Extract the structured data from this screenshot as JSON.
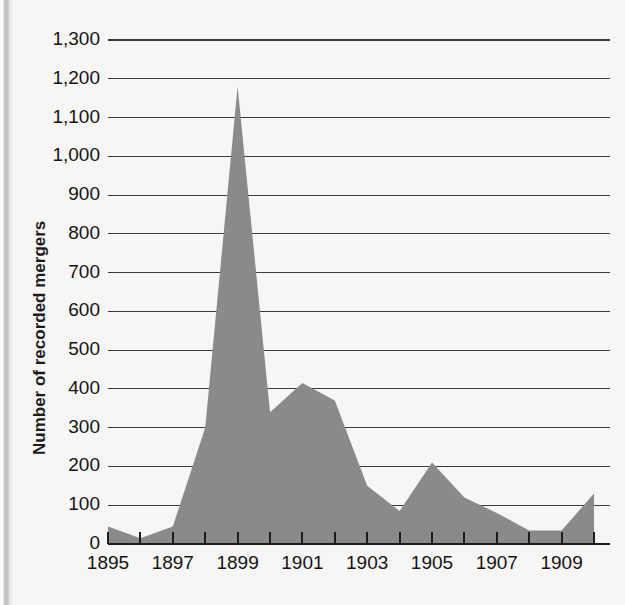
{
  "chart_data": {
    "type": "area",
    "title": "",
    "xlabel": "",
    "ylabel": "Number of recorded mergers",
    "x": [
      1895,
      1896,
      1897,
      1898,
      1899,
      1900,
      1901,
      1902,
      1903,
      1904,
      1905,
      1906,
      1907,
      1908,
      1909,
      1910
    ],
    "values": [
      45,
      15,
      45,
      300,
      1180,
      340,
      415,
      370,
      150,
      85,
      210,
      120,
      80,
      35,
      35,
      130
    ],
    "series": [
      {
        "name": "Recorded mergers",
        "values": [
          45,
          15,
          45,
          300,
          1180,
          340,
          415,
          370,
          150,
          85,
          210,
          120,
          80,
          35,
          35,
          130
        ]
      }
    ],
    "ylim": [
      0,
      1300
    ],
    "xlim": [
      1895,
      1910
    ],
    "y_ticks": [
      0,
      100,
      200,
      300,
      400,
      500,
      600,
      700,
      800,
      900,
      1000,
      1100,
      1200,
      1300
    ],
    "y_tick_labels": [
      "0",
      "100",
      "200",
      "300",
      "400",
      "500",
      "600",
      "700",
      "800",
      "900",
      "1,000",
      "1,100",
      "1,200",
      "1,300"
    ],
    "x_ticks": [
      1895,
      1896,
      1897,
      1898,
      1899,
      1900,
      1901,
      1902,
      1903,
      1904,
      1905,
      1906,
      1907,
      1908,
      1909,
      1910
    ],
    "x_tick_labels": [
      "1895",
      "",
      "1897",
      "",
      "1899",
      "",
      "1901",
      "",
      "1903",
      "",
      "1905",
      "",
      "1907",
      "",
      "1909",
      ""
    ],
    "x_labeled_ticks": [
      "1895",
      "1897",
      "1899",
      "1901",
      "1903",
      "1905",
      "1907",
      "1909"
    ],
    "grid": true,
    "legend": "none",
    "colors": {
      "area_fill": "#8a8a8a",
      "gridline": "#3b3b3b",
      "axis": "#1c1c1c",
      "background": "#f7f6f4",
      "text": "#141414"
    }
  }
}
